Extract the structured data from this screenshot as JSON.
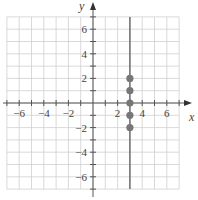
{
  "chart_data": {
    "type": "scatter",
    "title": "",
    "xlabel": "x",
    "ylabel": "y",
    "xlim": [
      -7,
      7
    ],
    "ylim": [
      -7,
      7
    ],
    "grid": true,
    "x_ticks": [
      -6,
      -4,
      -2,
      2,
      4,
      6
    ],
    "y_ticks": [
      -6,
      -4,
      -2,
      2,
      4,
      6
    ],
    "x_tick_labels": [
      "−6",
      "−4",
      "−2",
      "2",
      "4",
      "6"
    ],
    "y_tick_labels": [
      "−6",
      "−4",
      "−2",
      "2",
      "4",
      "6"
    ],
    "series": [
      {
        "name": "points",
        "x": [
          3,
          3,
          3,
          3,
          3
        ],
        "y": [
          2,
          1,
          0,
          -1,
          -2
        ]
      }
    ],
    "lines": [
      {
        "type": "vertical",
        "x": 3,
        "label": "x = 3"
      }
    ]
  },
  "colors": {
    "grid": "#cfcfcf",
    "axis": "#555555",
    "line": "#666666",
    "point": "#777777"
  }
}
